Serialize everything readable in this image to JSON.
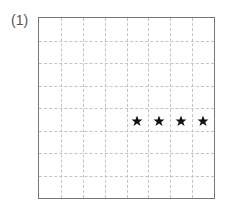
{
  "problem": {
    "label": "(1)"
  },
  "grid": {
    "columns": 8,
    "rows": 8,
    "border_color": "#777777",
    "line_color": "#c4c4c4"
  },
  "stars": [
    {
      "row": 4,
      "col": 4,
      "icon": "star-icon"
    },
    {
      "row": 4,
      "col": 5,
      "icon": "star-icon"
    },
    {
      "row": 4,
      "col": 6,
      "icon": "star-icon"
    },
    {
      "row": 4,
      "col": 7,
      "icon": "star-icon"
    }
  ],
  "colors": {
    "star": "#111111"
  }
}
